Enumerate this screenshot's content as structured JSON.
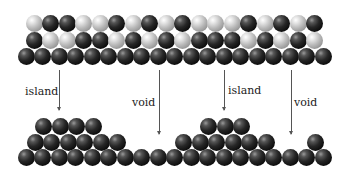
{
  "diagram": {
    "type": "atomic-surface-schematic",
    "ball_diameter": 17,
    "colors": {
      "dark_atom": "#151515",
      "light_atom": "#c8c8c8",
      "arrow": "#555555",
      "background": "#ffffff"
    },
    "top_structure": {
      "rows": [
        {
          "y": 23,
          "x_start": 34,
          "step": 16.5,
          "pattern": [
            "L",
            "D",
            "D",
            "L",
            "L",
            "D",
            "L",
            "D",
            "L",
            "D",
            "L",
            "L",
            "L",
            "D",
            "L",
            "D",
            "L",
            "D"
          ]
        },
        {
          "y": 40,
          "x_start": 34,
          "step": 16.5,
          "pattern": [
            "D",
            "L",
            "L",
            "D",
            "D",
            "L",
            "D",
            "L",
            "D",
            "L",
            "D",
            "D",
            "D",
            "L",
            "D",
            "L",
            "D",
            "L"
          ]
        },
        {
          "y": 56,
          "x_start": 26,
          "step": 16.5,
          "count": 19,
          "pattern_all": "D"
        }
      ]
    },
    "bottom_structure": {
      "rows": [
        {
          "y": 157,
          "x_start": 26,
          "step": 16.5,
          "count": 19
        },
        {
          "y": 142,
          "centers": [
            35,
            51,
            68,
            84,
            101,
            117,
            183,
            200,
            216,
            233,
            249,
            266,
            315
          ]
        },
        {
          "y": 126,
          "centers": [
            43,
            60,
            76,
            93,
            208,
            225,
            241
          ]
        }
      ]
    },
    "annotations": [
      {
        "label": "island",
        "arrow_x": 59,
        "arrow_top": 70,
        "arrow_bottom": 110,
        "label_x": 25,
        "label_y": 86
      },
      {
        "label": "void",
        "arrow_x": 159,
        "arrow_top": 70,
        "arrow_bottom": 134,
        "label_x": 132,
        "label_y": 97
      },
      {
        "label": "island",
        "arrow_x": 224,
        "arrow_top": 70,
        "arrow_bottom": 110,
        "label_x": 228,
        "label_y": 85
      },
      {
        "label": "void",
        "arrow_x": 291,
        "arrow_top": 70,
        "arrow_bottom": 134,
        "label_x": 294,
        "label_y": 97
      }
    ]
  }
}
